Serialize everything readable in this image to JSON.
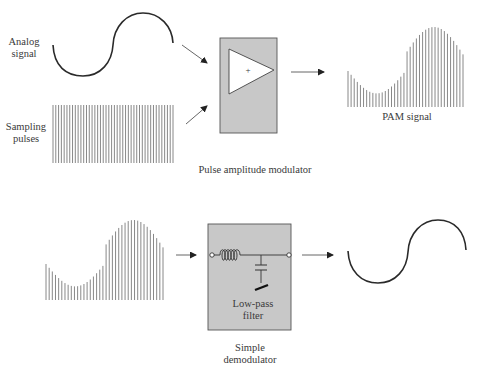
{
  "labels": {
    "analog_signal": [
      "Analog",
      "signal"
    ],
    "sampling_pulses": [
      "Sampling",
      "pulses"
    ],
    "pam_signal": "PAM signal",
    "modulator": "Pulse amplitude modulator",
    "amp_symbol": "+",
    "filter": [
      "Low-pass",
      "filter"
    ],
    "demodulator": [
      "Simple",
      "demodulator"
    ]
  },
  "colors": {
    "box_fill": "#c8c8c8",
    "box_stroke": "#555555",
    "signal_stroke": "#2a2a2a",
    "pulse_stroke": "#6a6a6a",
    "arrow": "#333333"
  },
  "sampling": {
    "pulse_count": 44
  },
  "pam": {
    "pulse_count": 38
  }
}
